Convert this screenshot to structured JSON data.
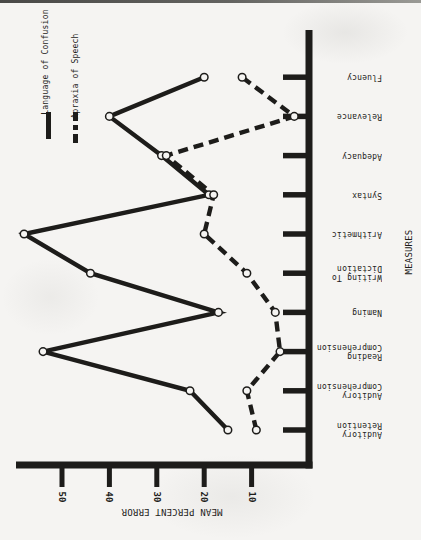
{
  "palette": {
    "paper": "#f5f4f2",
    "ink": "#1d1c1a"
  },
  "legend": {
    "items": [
      {
        "label": "Language of Confusion",
        "line": "solid"
      },
      {
        "label": "Apraxia of Speech",
        "line": "dashed"
      }
    ]
  },
  "chart_data": {
    "type": "line",
    "orientation": "figure rotated 90 degrees counterclockwise on page",
    "marker": "open-circle",
    "categories": [
      {
        "name": "Auditory Retention",
        "lines": [
          "Auditory",
          "Retention"
        ]
      },
      {
        "name": "Auditory Comprehension",
        "lines": [
          "Auditory",
          "Comprehension"
        ]
      },
      {
        "name": "Reading Comprehension",
        "lines": [
          "Reading",
          "Comprehension"
        ]
      },
      {
        "name": "Naming",
        "lines": [
          "Naming"
        ]
      },
      {
        "name": "Writing To Dictation",
        "lines": [
          "Writing To",
          "Dictation"
        ]
      },
      {
        "name": "Arithmetic",
        "lines": [
          "Arithmetic"
        ]
      },
      {
        "name": "Syntax",
        "lines": [
          "Syntax"
        ]
      },
      {
        "name": "Adequacy",
        "lines": [
          "Adequacy"
        ]
      },
      {
        "name": "Relevance",
        "lines": [
          "Relevance"
        ]
      },
      {
        "name": "Fluency",
        "lines": [
          "Fluency"
        ]
      }
    ],
    "series": [
      {
        "name": "Language of Confusion",
        "line": "solid",
        "values": [
          15,
          23,
          54,
          17,
          44,
          58,
          19,
          29,
          40,
          20
        ]
      },
      {
        "name": "Apraxia of Speech",
        "line": "dashed",
        "values": [
          9,
          11,
          4,
          5,
          11,
          20,
          18,
          28,
          1,
          12
        ]
      }
    ],
    "value_axis": {
      "label": "MEAN PERCENT ERROR",
      "ticks": [
        50,
        40,
        30,
        20,
        10
      ],
      "min": 0,
      "max": 60
    },
    "category_axis": {
      "label": "MEASURES"
    }
  }
}
